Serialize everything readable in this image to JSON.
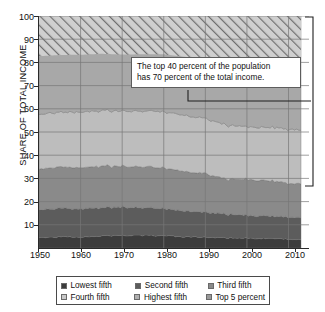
{
  "chart_data": {
    "type": "area",
    "title": "",
    "xlabel": "",
    "ylabel": "SHARE OF TOTAL INCOME",
    "xlim": [
      1950,
      2013
    ],
    "ylim": [
      0,
      100
    ],
    "grid": true,
    "stacked": true,
    "legend_position": "bottom",
    "y_ticks": [
      10,
      20,
      30,
      40,
      50,
      60,
      70,
      80,
      90,
      100
    ],
    "x_ticks": [
      1950,
      1960,
      1970,
      1980,
      1990,
      2000,
      2010
    ],
    "x": [
      1950,
      1955,
      1960,
      1965,
      1970,
      1975,
      1980,
      1985,
      1990,
      1995,
      2000,
      2005,
      2010,
      2013
    ],
    "series": [
      {
        "name": "Lowest fifth",
        "color": "#3c3c3c",
        "values": [
          4.5,
          4.8,
          4.8,
          5.2,
          5.4,
          5.4,
          5.3,
          4.8,
          4.6,
          4.4,
          4.3,
          4.0,
          3.8,
          3.6
        ]
      },
      {
        "name": "Second fifth",
        "color": "#5c5c5c",
        "values": [
          12.0,
          12.3,
          12.2,
          12.2,
          12.2,
          11.8,
          11.6,
          11.0,
          10.8,
          10.1,
          9.8,
          9.6,
          9.5,
          9.4
        ]
      },
      {
        "name": "Third fifth",
        "color": "#8a8a8a",
        "values": [
          17.4,
          17.8,
          17.8,
          17.8,
          17.6,
          17.6,
          17.5,
          16.9,
          16.6,
          15.2,
          15.4,
          15.3,
          14.6,
          14.4
        ]
      },
      {
        "name": "Fourth fifth",
        "color": "#bdbdbd",
        "values": [
          23.6,
          23.7,
          24.0,
          23.9,
          23.8,
          24.1,
          24.3,
          24.2,
          23.8,
          23.3,
          22.7,
          22.9,
          23.4,
          23.0
        ]
      },
      {
        "name": "Highest fifth",
        "color": "#a8a8a8",
        "values": [
          42.5,
          41.4,
          41.2,
          40.9,
          41.0,
          41.1,
          41.3,
          43.1,
          44.2,
          47.0,
          47.8,
          48.2,
          48.7,
          49.6
        ]
      },
      {
        "name": "Top 5 percent",
        "color": "#b5b5b5",
        "pattern": "diagonal-hatch",
        "note": "subset of Highest fifth, drawn hatched at top of stack",
        "values": [
          17.3,
          16.8,
          16.7,
          16.3,
          16.6,
          16.5,
          16.5,
          17.6,
          18.6,
          20.7,
          21.1,
          21.1,
          20.0,
          20.0
        ]
      }
    ],
    "annotation": {
      "line1": "The top 40 percent of the population",
      "line2": "has 70 percent of the total income.",
      "bracket_from": 100,
      "bracket_to": 30
    }
  },
  "axes": {
    "y_title": "SHARE OF TOTAL INCOME",
    "y_ticks": [
      "100",
      "90",
      "80",
      "70",
      "60",
      "50",
      "40",
      "30",
      "20",
      "10"
    ],
    "x_ticks": [
      "1950",
      "1960",
      "1970",
      "1980",
      "1990",
      "2000",
      "2010"
    ]
  },
  "annotation": {
    "line1": "The top 40 percent of the population",
    "line2": "has 70 percent of the total income."
  },
  "legend": {
    "items": [
      {
        "label": "Lowest fifth",
        "color": "#3c3c3c"
      },
      {
        "label": "Second fifth",
        "color": "#5c5c5c"
      },
      {
        "label": "Third fifth",
        "color": "#8a8a8a"
      },
      {
        "label": "Fourth fifth",
        "color": "#c8c8c8"
      },
      {
        "label": "Highest fifth",
        "color": "#b0b0b0"
      },
      {
        "label": "Top 5 percent",
        "color": "#9a9a9a"
      }
    ]
  }
}
